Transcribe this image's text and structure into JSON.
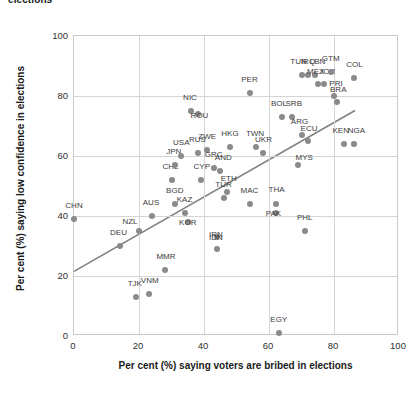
{
  "chart_data": {
    "type": "scatter",
    "title": "elections",
    "xlabel": "Per cent (%) saying voters are bribed in elections",
    "ylabel": "Per cent (%) saying low confidence in elections",
    "xlim": [
      0,
      100
    ],
    "ylim": [
      0,
      100
    ],
    "xticks": [
      0,
      20,
      40,
      60,
      80,
      100
    ],
    "yticks": [
      0,
      20,
      40,
      60,
      80,
      100
    ],
    "grid": true,
    "legend": "none",
    "marker_color": "#8a8a8a",
    "trendline_color": "#808080",
    "trendline": {
      "x0": 0,
      "y0": 21,
      "x1": 87,
      "y1": 75
    },
    "points": [
      {
        "label": "CHN",
        "x": 0,
        "y": 39,
        "label_dx": 0,
        "label_dy": -5
      },
      {
        "label": "DEU",
        "x": 14,
        "y": 30,
        "label_dx": -1,
        "label_dy": -5
      },
      {
        "label": "NZL",
        "x": 20,
        "y": 35,
        "label_dx": -9,
        "label_dy": -1
      },
      {
        "label": "AUS",
        "x": 24,
        "y": 40,
        "label_dx": -1,
        "label_dy": -5
      },
      {
        "label": "TJK",
        "x": 19,
        "y": 13,
        "label_dx": -1,
        "label_dy": -5
      },
      {
        "label": "VNM",
        "x": 23,
        "y": 14,
        "label_dx": 1,
        "label_dy": -5
      },
      {
        "label": "MMR",
        "x": 28,
        "y": 22,
        "label_dx": 1,
        "label_dy": -5
      },
      {
        "label": "CHL",
        "x": 30,
        "y": 52,
        "label_dx": -1,
        "label_dy": -5
      },
      {
        "label": "JPN",
        "x": 31,
        "y": 57,
        "label_dx": -1,
        "label_dy": -5
      },
      {
        "label": "BGD",
        "x": 31,
        "y": 44,
        "label_dx": 0,
        "label_dy": -5
      },
      {
        "label": "USA",
        "x": 33,
        "y": 60,
        "label_dx": 0,
        "label_dy": -5
      },
      {
        "label": "KAZ",
        "x": 34,
        "y": 41,
        "label_dx": 0,
        "label_dy": -5
      },
      {
        "label": "KOR",
        "x": 35,
        "y": 38,
        "label_dx": 0,
        "label_dy": 9
      },
      {
        "label": "NIC",
        "x": 36,
        "y": 75,
        "label_dx": -1,
        "label_dy": -5
      },
      {
        "label": "ROU",
        "x": 38,
        "y": 74,
        "label_dx": 2,
        "label_dy": 10
      },
      {
        "label": "RUS",
        "x": 38,
        "y": 61,
        "label_dx": 0,
        "label_dy": -5
      },
      {
        "label": "CYP",
        "x": 39,
        "y": 52,
        "label_dx": 1,
        "label_dy": -5
      },
      {
        "label": "ZWE",
        "x": 41,
        "y": 62,
        "label_dx": 0,
        "label_dy": -5
      },
      {
        "label": "GRC",
        "x": 43,
        "y": 56,
        "label_dx": 0,
        "label_dy": -5
      },
      {
        "label": "AND",
        "x": 45,
        "y": 55,
        "label_dx": 3,
        "label_dy": -5
      },
      {
        "label": "IDN",
        "x": 44,
        "y": 33,
        "label_dx": -1,
        "label_dy": 9
      },
      {
        "label": "IRN",
        "x": 44,
        "y": 29,
        "label_dx": -1,
        "label_dy": -6
      },
      {
        "label": "TUR",
        "x": 46,
        "y": 46,
        "label_dx": 0,
        "label_dy": -5
      },
      {
        "label": "ETH",
        "x": 47,
        "y": 48,
        "label_dx": 2,
        "label_dy": -5
      },
      {
        "label": "HKG",
        "x": 48,
        "y": 63,
        "label_dx": 0,
        "label_dy": -5
      },
      {
        "label": "PER",
        "x": 54,
        "y": 81,
        "label_dx": 0,
        "label_dy": -5
      },
      {
        "label": "MAC",
        "x": 54,
        "y": 44,
        "label_dx": 0,
        "label_dy": -5
      },
      {
        "label": "TWN",
        "x": 56,
        "y": 63,
        "label_dx": -1,
        "label_dy": -5
      },
      {
        "label": "UKR",
        "x": 58,
        "y": 61,
        "label_dx": 1,
        "label_dy": -5
      },
      {
        "label": "PAK",
        "x": 62,
        "y": 41,
        "label_dx": -2,
        "label_dy": 9
      },
      {
        "label": "THA",
        "x": 62,
        "y": 44,
        "label_dx": 1,
        "label_dy": -6
      },
      {
        "label": "EGY",
        "x": 63,
        "y": 1,
        "label_dx": 0,
        "label_dy": -5
      },
      {
        "label": "BOL",
        "x": 64,
        "y": 73,
        "label_dx": -3,
        "label_dy": -5
      },
      {
        "label": "SRB",
        "x": 67,
        "y": 73,
        "label_dx": 2,
        "label_dy": -5
      },
      {
        "label": "TUN",
        "x": 70,
        "y": 87,
        "label_dx": -3,
        "label_dy": -5
      },
      {
        "label": "IRQ",
        "x": 72,
        "y": 87,
        "label_dx": 0,
        "label_dy": -5
      },
      {
        "label": "LBN",
        "x": 74,
        "y": 87,
        "label_dx": 3,
        "label_dy": -5
      },
      {
        "label": "ARG",
        "x": 70,
        "y": 67,
        "label_dx": -2,
        "label_dy": -5
      },
      {
        "label": "ECU",
        "x": 72,
        "y": 65,
        "label_dx": 1,
        "label_dy": -4
      },
      {
        "label": "PHL",
        "x": 71,
        "y": 35,
        "label_dx": 0,
        "label_dy": -5
      },
      {
        "label": "MYS",
        "x": 69,
        "y": 57,
        "label_dx": 6,
        "label_dy": 1
      },
      {
        "label": "MEX",
        "x": 75,
        "y": 84,
        "label_dx": -2,
        "label_dy": -4
      },
      {
        "label": "JOR",
        "x": 77,
        "y": 84,
        "label_dx": 3,
        "label_dy": -4
      },
      {
        "label": "GTM",
        "x": 79,
        "y": 88,
        "label_dx": 0,
        "label_dy": -5
      },
      {
        "label": "PRI",
        "x": 80,
        "y": 80,
        "label_dx": 2,
        "label_dy": -4
      },
      {
        "label": "BRA",
        "x": 81,
        "y": 78,
        "label_dx": 1,
        "label_dy": -4
      },
      {
        "label": "KEN",
        "x": 83,
        "y": 64,
        "label_dx": -3,
        "label_dy": -5
      },
      {
        "label": "NGA",
        "x": 86,
        "y": 64,
        "label_dx": 3,
        "label_dy": -5
      },
      {
        "label": "COL",
        "x": 86,
        "y": 86,
        "label_dx": 1,
        "label_dy": -5
      }
    ]
  }
}
